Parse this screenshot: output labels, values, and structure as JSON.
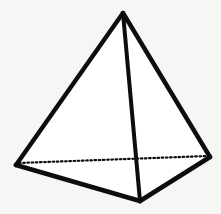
{
  "figure": {
    "shape_name": "triangular-pyramid",
    "background_color": "#f6f6f4",
    "edge_color": "#0d0d0d",
    "face_color": "#ffffff",
    "solid_edge_width": 4.4,
    "hidden_edge_width": 2.2,
    "hidden_edge_dash": "1.6 2.6",
    "vertices": {
      "apex": {
        "label": "apex",
        "x": 123,
        "y": 13
      },
      "base_left": {
        "label": "base-left",
        "x": 16,
        "y": 165
      },
      "base_right": {
        "label": "base-right",
        "x": 210,
        "y": 157
      },
      "base_front": {
        "label": "base-front",
        "x": 140,
        "y": 201
      }
    },
    "faces": [
      {
        "name": "front-left-face",
        "points": "123,13 16,165 140,201"
      },
      {
        "name": "front-right-face",
        "points": "123,13 140,201 210,157"
      }
    ],
    "edges": [
      {
        "name": "edge-apex-to-base-left",
        "visible": true,
        "from": "apex",
        "to": "base_left",
        "points": "123,13 16,165"
      },
      {
        "name": "edge-apex-to-base-right",
        "visible": true,
        "from": "apex",
        "to": "base_right",
        "points": "123,13 210,157"
      },
      {
        "name": "edge-apex-to-base-front",
        "visible": true,
        "from": "apex",
        "to": "base_front",
        "points": "123,13 140,201"
      },
      {
        "name": "edge-base-left-to-front",
        "visible": true,
        "from": "base_left",
        "to": "base_front",
        "points": "16,165 140,201"
      },
      {
        "name": "edge-base-front-to-right",
        "visible": true,
        "from": "base_front",
        "to": "base_right",
        "points": "140,201 210,157"
      },
      {
        "name": "edge-base-left-to-right",
        "visible": false,
        "from": "base_left",
        "to": "base_right",
        "points": "19,163 208,156"
      }
    ]
  }
}
